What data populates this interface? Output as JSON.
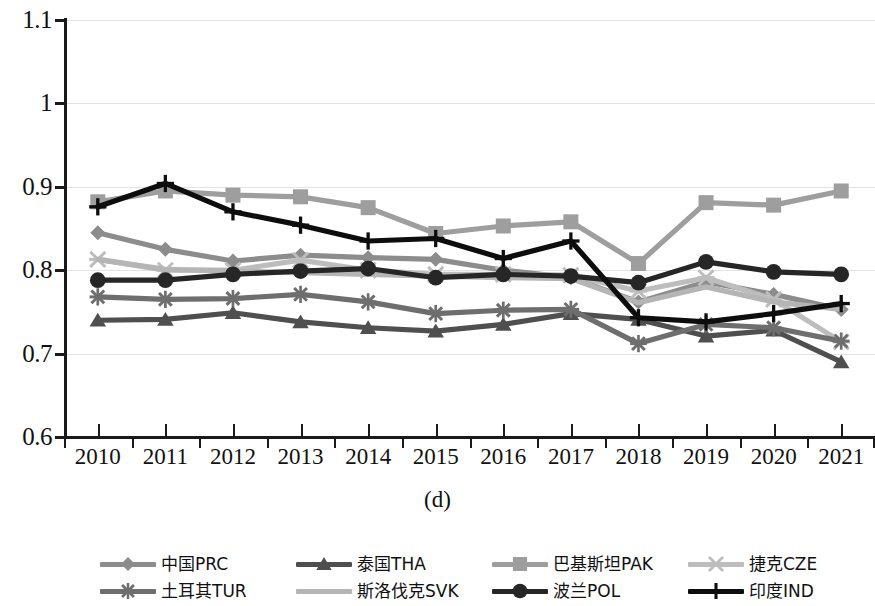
{
  "caption": "(d)",
  "axis": {
    "y_ticks": [
      "0.6",
      "0.7",
      "0.8",
      "0.9",
      "1",
      "1.1"
    ],
    "x_ticks": [
      "2010",
      "2011",
      "2012",
      "2013",
      "2014",
      "2015",
      "2016",
      "2017",
      "2018",
      "2019",
      "2020",
      "2021"
    ]
  },
  "legend": {
    "items": [
      {
        "label": "中国PRC",
        "marker": "diamond",
        "color": "#8c8c8c",
        "row": 0,
        "col": 0
      },
      {
        "label": "泰国THA",
        "marker": "triangle",
        "color": "#4f4f4f",
        "row": 0,
        "col": 1
      },
      {
        "label": "巴基斯坦PAK",
        "marker": "square",
        "color": "#9e9e9e",
        "row": 0,
        "col": 2
      },
      {
        "label": "捷克CZE",
        "marker": "star",
        "color": "#bdbdbd",
        "row": 0,
        "col": 3
      },
      {
        "label": "土耳其TUR",
        "marker": "asterisk",
        "color": "#6e6e6e",
        "row": 1,
        "col": 0
      },
      {
        "label": "斯洛伐克SVK",
        "marker": "line",
        "color": "#b5b5b5",
        "row": 1,
        "col": 1
      },
      {
        "label": "波兰POL",
        "marker": "circle",
        "color": "#262626",
        "row": 1,
        "col": 2
      },
      {
        "label": "印度IND",
        "marker": "plus",
        "color": "#0d0d0d",
        "row": 1,
        "col": 3
      }
    ]
  },
  "chart_data": {
    "type": "line",
    "title": "",
    "subtitle": "(d)",
    "xlabel": "",
    "ylabel": "",
    "x": [
      "2010",
      "2011",
      "2012",
      "2013",
      "2014",
      "2015",
      "2016",
      "2017",
      "2018",
      "2019",
      "2020",
      "2021"
    ],
    "ylim": [
      0.6,
      1.1
    ],
    "yticks": [
      0.6,
      0.7,
      0.8,
      0.9,
      1.0,
      1.1
    ],
    "grid": true,
    "legend_position": "bottom",
    "series": [
      {
        "name": "中国PRC",
        "marker": "diamond",
        "color": "#8c8c8c",
        "values": [
          0.845,
          0.825,
          0.811,
          0.818,
          0.815,
          0.813,
          0.8,
          0.791,
          0.762,
          0.786,
          0.771,
          0.753
        ]
      },
      {
        "name": "泰国THA",
        "marker": "triangle",
        "color": "#4f4f4f",
        "values": [
          0.74,
          0.741,
          0.749,
          0.738,
          0.731,
          0.727,
          0.735,
          0.748,
          0.741,
          0.721,
          0.728,
          0.69
        ]
      },
      {
        "name": "巴基斯坦PAK",
        "marker": "square",
        "color": "#9e9e9e",
        "values": [
          0.882,
          0.895,
          0.89,
          0.888,
          0.875,
          0.844,
          0.853,
          0.858,
          0.808,
          0.881,
          0.878,
          0.895
        ]
      },
      {
        "name": "捷克CZE",
        "marker": "star",
        "color": "#bdbdbd",
        "values": [
          0.813,
          0.8,
          0.8,
          0.812,
          0.8,
          0.795,
          0.795,
          0.794,
          0.775,
          0.791,
          0.765,
          0.714
        ]
      },
      {
        "name": "土耳其TUR",
        "marker": "asterisk",
        "color": "#6e6e6e",
        "values": [
          0.768,
          0.765,
          0.766,
          0.771,
          0.762,
          0.748,
          0.752,
          0.753,
          0.712,
          0.735,
          0.731,
          0.715
        ]
      },
      {
        "name": "斯洛伐克SVK",
        "marker": "line",
        "color": "#b5b5b5",
        "values": [
          0.813,
          0.801,
          0.799,
          0.797,
          0.795,
          0.793,
          0.791,
          0.79,
          0.761,
          0.78,
          0.762,
          0.753
        ]
      },
      {
        "name": "波兰POL",
        "marker": "circle",
        "color": "#262626",
        "values": [
          0.788,
          0.788,
          0.795,
          0.799,
          0.802,
          0.791,
          0.795,
          0.793,
          0.785,
          0.81,
          0.798,
          0.795
        ]
      },
      {
        "name": "印度IND",
        "marker": "plus",
        "color": "#0d0d0d",
        "values": [
          0.876,
          0.904,
          0.87,
          0.854,
          0.835,
          0.838,
          0.814,
          0.835,
          0.743,
          0.738,
          0.748,
          0.76
        ]
      }
    ]
  }
}
